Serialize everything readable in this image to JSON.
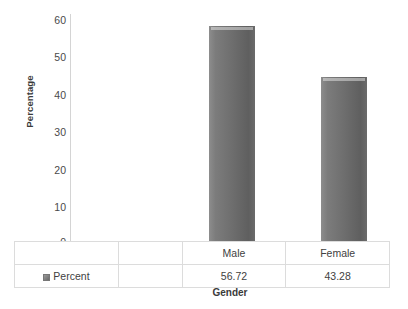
{
  "chart_data": {
    "type": "bar",
    "title": "",
    "subtitle": "",
    "xlabel": "Gender",
    "ylabel": "Percentage",
    "categories": [
      "Male",
      "Female"
    ],
    "values": [
      56.72,
      43.28
    ],
    "series": [
      {
        "name": "Percent",
        "values": [
          56.72,
          43.28
        ]
      }
    ],
    "value_labels": [
      "56.72",
      "43.28"
    ],
    "ylim": [
      0,
      60
    ],
    "ytick_labels": [
      "60",
      "50",
      "40",
      "30",
      "20",
      "10",
      "0"
    ],
    "ytick_values": [
      60,
      50,
      40,
      30,
      20,
      10,
      0
    ],
    "grid": false,
    "legend_position": "bottom-table",
    "bar_color": "#6e6e6e",
    "axis_color": "#d4d4d4"
  },
  "axes": {
    "y_title": "Percentage",
    "x_title": "Gender"
  },
  "table": {
    "legend_marker": "legend-swatch-icon",
    "series_label": "Percent",
    "header_cells": [
      "Male",
      "Female"
    ],
    "value_cells": [
      "56.72",
      "43.28"
    ]
  }
}
